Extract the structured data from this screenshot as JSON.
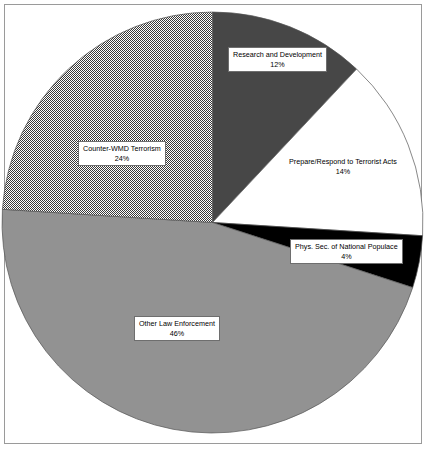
{
  "figure": {
    "type": "pie-chart-figure",
    "frame_color": "#9a9a9a",
    "background": "#ffffff"
  },
  "chart_data": {
    "type": "pie",
    "title": "",
    "subtitle": "",
    "xlabel": "",
    "ylabel": "",
    "legend_position": "none",
    "grid": false,
    "start_angle_deg": 0,
    "direction": "clockwise",
    "units": "percent",
    "total": 100,
    "categories": [
      "Research and Development",
      "Prepare/Respond to Terrorist Acts",
      "Phys. Sec. of National Populace",
      "Other Law Enforcement",
      "Counter-WMD Terrorism"
    ],
    "values": [
      12,
      14,
      4,
      46,
      24
    ],
    "labels": [
      "Research and Development",
      "Prepare/Respond to Terrorist Acts",
      "Phys. Sec. of National Populace",
      "Other Law Enforcement",
      "Counter-WMD Terrorism"
    ],
    "value_labels": [
      "12%",
      "14%",
      "4%",
      "46%",
      "24%"
    ],
    "colors": [
      "#474747",
      "#ffffff",
      "#000000",
      "#929292",
      "#d0d0d0"
    ],
    "fill_styles": [
      "solid",
      "solid",
      "solid",
      "solid",
      "checker-hatch"
    ],
    "slices": [
      {
        "name": "Research and Development",
        "value": 12,
        "value_label": "12%",
        "color": "#474747",
        "fill_style": "solid",
        "label_boxed": true
      },
      {
        "name": "Prepare/Respond to Terrorist Acts",
        "value": 14,
        "value_label": "14%",
        "color": "#ffffff",
        "fill_style": "solid",
        "label_boxed": false
      },
      {
        "name": "Phys. Sec. of National Populace",
        "value": 4,
        "value_label": "4%",
        "color": "#000000",
        "fill_style": "solid",
        "label_boxed": true
      },
      {
        "name": "Other Law Enforcement",
        "value": 46,
        "value_label": "46%",
        "color": "#929292",
        "fill_style": "solid",
        "label_boxed": true
      },
      {
        "name": "Counter-WMD Terrorism",
        "value": 24,
        "value_label": "24%",
        "color": "#d0d0d0",
        "fill_style": "checker-hatch",
        "label_boxed": true
      }
    ]
  }
}
